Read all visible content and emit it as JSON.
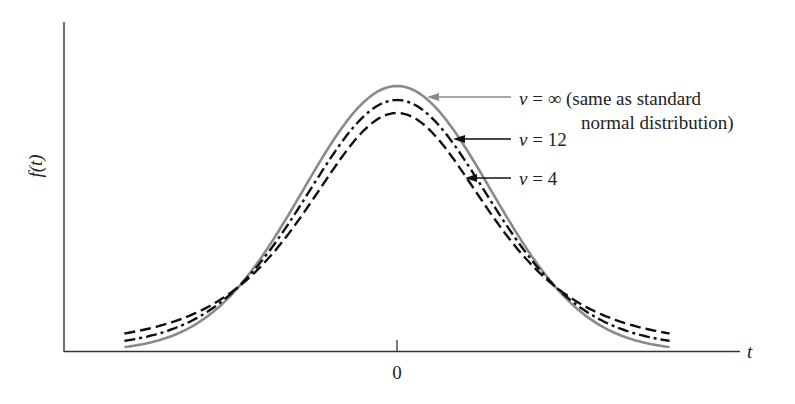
{
  "chart_data": {
    "type": "line",
    "title": "",
    "xlabel": "t",
    "ylabel": "f(t)",
    "x_ticks": [
      0
    ],
    "x_tick_labels": [
      "0"
    ],
    "y_ticks": [],
    "grid": false,
    "legend_position": "annotations with arrows, right of peak",
    "x_range": [
      -2.9,
      2.9
    ],
    "series": [
      {
        "name": "v = ∞ (same as standard normal distribution)",
        "df": "infinity",
        "style": "solid",
        "color": "#8a8a8a",
        "peak_density": 0.399
      },
      {
        "name": "v = 12",
        "df": 12,
        "style": "dash-dot",
        "color": "#111111",
        "peak_density": 0.391
      },
      {
        "name": "v = 4",
        "df": 4,
        "style": "dashed",
        "color": "#111111",
        "peak_density": 0.375
      }
    ],
    "annotations": [
      {
        "text_line1": "v = ∞ (same as standard",
        "text_line2": "normal distribution)",
        "points_to": "v = ∞ curve"
      },
      {
        "text": "v = 12",
        "points_to": "v = 12 curve"
      },
      {
        "text": "v = 4",
        "points_to": "v = 4 curve"
      }
    ]
  },
  "labels": {
    "ylabel": "f(t)",
    "xlabel": "t",
    "tick0": "0",
    "inf_line1_v": "v",
    "inf_line1_rest": " = ∞ (same as standard",
    "inf_line2": "normal distribution)",
    "v12_v": "v",
    "v12_rest": " = 12",
    "v4_v": "v",
    "v4_rest": " = 4"
  },
  "colors": {
    "axis": "#333333",
    "normal": "#8a8a8a",
    "t_curves": "#111111",
    "arrow_normal": "#8a8a8a",
    "arrow_t": "#111111",
    "text": "#222222"
  }
}
